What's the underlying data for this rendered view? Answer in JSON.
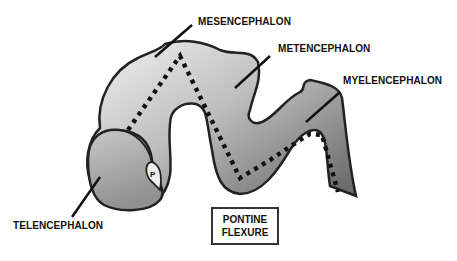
{
  "diagram": {
    "type": "embryonic-brain-vesicles",
    "labels": {
      "mesencephalon": "MESENCEPHALON",
      "metencephalon": "METENCEPHALON",
      "myelencephalon": "MYELENCEPHALON",
      "telencephalon": "TELENCEPHALON"
    },
    "flexure_box": {
      "line1": "PONTINE",
      "line2": "FLEXURE"
    },
    "inner_mark": "P",
    "colors": {
      "outline": "#222222",
      "fill_light": "#f2f2f2",
      "fill_dark": "#6a6a6a",
      "dots": "#111111"
    }
  }
}
